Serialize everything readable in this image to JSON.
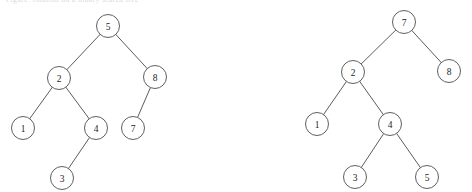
{
  "figure": {
    "caption_remnant": "Figure: rotation on a binary search tree",
    "background_color": "#ffffff",
    "stroke_color": "#4d4d4d",
    "text_color": "#1d1d1d",
    "node_radius": 11.5
  },
  "chart_data": {
    "type": "diagram",
    "title": "",
    "subtitle": "",
    "diagram_kind": "binary-search-tree-pair",
    "trees": [
      {
        "name": "left-tree",
        "root": "5",
        "nodes": [
          {
            "id": "L5",
            "label": "5",
            "x": 108,
            "y": 26
          },
          {
            "id": "L2",
            "label": "2",
            "x": 59,
            "y": 78
          },
          {
            "id": "L8",
            "label": "8",
            "x": 155,
            "y": 77
          },
          {
            "id": "L1",
            "label": "1",
            "x": 23,
            "y": 128
          },
          {
            "id": "L4",
            "label": "4",
            "x": 96,
            "y": 128
          },
          {
            "id": "L7",
            "label": "7",
            "x": 133,
            "y": 128
          },
          {
            "id": "L3",
            "label": "3",
            "x": 62,
            "y": 178
          }
        ],
        "edges": [
          {
            "from": "L5",
            "to": "L2"
          },
          {
            "from": "L5",
            "to": "L8"
          },
          {
            "from": "L2",
            "to": "L1"
          },
          {
            "from": "L2",
            "to": "L4"
          },
          {
            "from": "L8",
            "to": "L7"
          },
          {
            "from": "L4",
            "to": "L3"
          }
        ]
      },
      {
        "name": "right-tree",
        "root": "7",
        "nodes": [
          {
            "id": "R7",
            "label": "7",
            "x": 404,
            "y": 22
          },
          {
            "id": "R2",
            "label": "2",
            "x": 353,
            "y": 72
          },
          {
            "id": "R8",
            "label": "8",
            "x": 449,
            "y": 71
          },
          {
            "id": "R1",
            "label": "1",
            "x": 317,
            "y": 124
          },
          {
            "id": "R4",
            "label": "4",
            "x": 390,
            "y": 124
          },
          {
            "id": "R3",
            "label": "3",
            "x": 355,
            "y": 177
          },
          {
            "id": "R5",
            "label": "5",
            "x": 427,
            "y": 177
          }
        ],
        "edges": [
          {
            "from": "R7",
            "to": "R2"
          },
          {
            "from": "R7",
            "to": "R8"
          },
          {
            "from": "R2",
            "to": "R1"
          },
          {
            "from": "R2",
            "to": "R4"
          },
          {
            "from": "R4",
            "to": "R3"
          },
          {
            "from": "R4",
            "to": "R5"
          }
        ]
      }
    ]
  }
}
